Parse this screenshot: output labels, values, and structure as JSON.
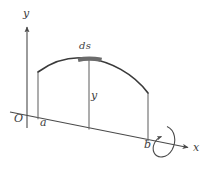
{
  "figure": {
    "background_color": "#ffffff",
    "stroke_color": "#4a4a4a",
    "curve_color": "#3a3a3a",
    "highlight_color": "#6b6b6b",
    "label_color": "#3d3d3d"
  },
  "labels": {
    "axis_y": "y",
    "axis_x": "x",
    "origin": "O",
    "left_bound": "a",
    "right_bound": "b",
    "arc_element": "ds",
    "height": "y"
  },
  "geometry": {
    "y_axis": {
      "x": 27,
      "y_top": 25,
      "y_bottom": 128
    },
    "x_axis": {
      "x_start": 10,
      "y_start": 112,
      "x_end": 190,
      "y_end": 148
    },
    "curve": {
      "start": [
        38,
        72
      ],
      "peak": [
        89,
        59
      ],
      "end": [
        148,
        93
      ]
    },
    "ordinate_a": {
      "x": 38,
      "y_top": 72,
      "y_bottom": 119
    },
    "ordinate_mid": {
      "x": 89,
      "y_top": 60,
      "y_bottom": 129
    },
    "ordinate_b": {
      "x": 148,
      "y_top": 93,
      "y_bottom": 141
    },
    "arc_segment": {
      "x_start": 78,
      "x_end": 101,
      "y": 59
    },
    "rotation_loop": {
      "center_x": 165,
      "center_y": 142,
      "rx": 9,
      "ry": 17
    }
  },
  "elements": {
    "y_axis_name": "y-axis",
    "x_axis_name": "x-axis",
    "curve_name": "function-curve",
    "rotation_name": "rotation-arrow"
  }
}
